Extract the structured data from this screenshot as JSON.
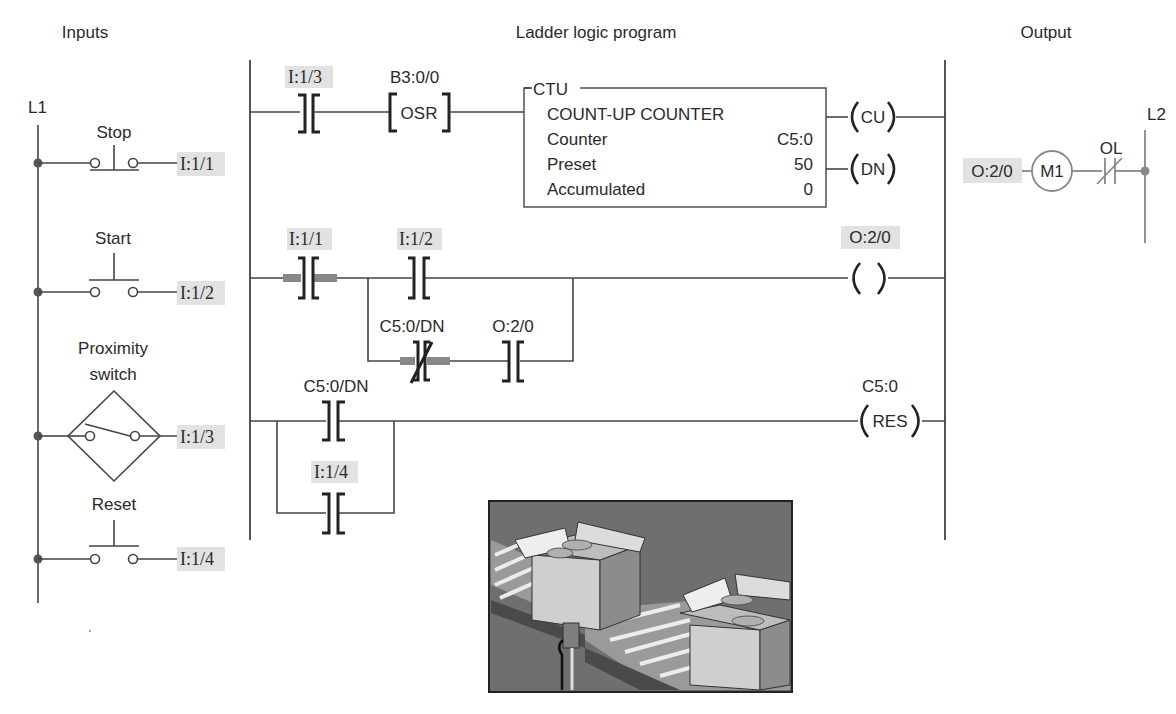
{
  "headers": {
    "inputs": "Inputs",
    "program": "Ladder logic program",
    "output": "Output"
  },
  "inputs": {
    "rail_label": "L1",
    "devices": [
      {
        "name": "Stop",
        "type": "pushbutton-nc",
        "address": "I:1/1"
      },
      {
        "name": "Start",
        "type": "pushbutton-no",
        "address": "I:1/2"
      },
      {
        "name_line1": "Proximity",
        "name_line2": "switch",
        "type": "proximity-switch",
        "address": "I:1/3"
      },
      {
        "name": "Reset",
        "type": "pushbutton-no",
        "address": "I:1/4"
      }
    ]
  },
  "ladder": {
    "rung1": {
      "contact_address": "I:1/3",
      "osr_address": "B3:0/0",
      "osr_label": "OSR",
      "ctu": {
        "header": "CTU",
        "title": "COUNT-UP COUNTER",
        "rows": [
          {
            "label": "Counter",
            "value": "C5:0"
          },
          {
            "label": "Preset",
            "value": "50"
          },
          {
            "label": "Accumulated",
            "value": "0"
          }
        ]
      },
      "coil_cu": "CU",
      "coil_dn": "DN"
    },
    "rung2": {
      "contact1_address": "I:1/1",
      "contact2_address": "I:1/2",
      "branch_nc_address": "C5:0/DN",
      "branch_no_address": "O:2/0",
      "coil_address": "O:2/0"
    },
    "rung3": {
      "contact_address": "C5:0/DN",
      "branch_address": "I:1/4",
      "coil_address": "C5:0",
      "coil_label": "RES"
    }
  },
  "output": {
    "rail_label": "L2",
    "address": "O:2/0",
    "motor_label": "M1",
    "overload_label": "OL"
  },
  "illustration": {
    "description": "conveyor-with-boxes-and-proximity-sensor"
  },
  "colors": {
    "line": "#444444",
    "tag_bg": "#e2e2e2",
    "highlight": "#888888",
    "output_gray": "#888888"
  }
}
